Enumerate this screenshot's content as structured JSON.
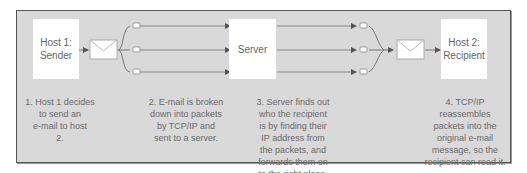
{
  "diagram": {
    "colors": {
      "background": "#d9d9d9",
      "frame_border": "#555555",
      "node_fill": "#ffffff",
      "line": "#777777",
      "text": "#666666"
    },
    "nodes": {
      "sender": {
        "label_line1": "Host 1:",
        "label_line2": "Sender"
      },
      "server": {
        "label": "Server"
      },
      "recipient": {
        "label_line1": "Host 2:",
        "label_line2": "Recipient"
      }
    },
    "icons": {
      "email_envelope": "envelope-icon",
      "packet": "packet-icon",
      "arrow": "arrowhead-icon"
    },
    "captions": [
      {
        "step": 1,
        "text": "1. Host 1 decides to send an e-mail to host 2."
      },
      {
        "step": 2,
        "text": "2. E-mail is broken down into packets by TCP/IP and sent to a server."
      },
      {
        "step": 3,
        "text": "3. Server finds out who the recipient is by finding their IP address from the packets, and forwards them on to the right place."
      },
      {
        "step": 4,
        "text": "4. TCP/IP reassembles packets into the original e-mail message, so the recipient can read it."
      }
    ],
    "caption_lines": {
      "c1": [
        "1. Host 1 decides",
        "to send an",
        "e-mail to host",
        "2."
      ],
      "c2": [
        "2. E-mail is broken",
        "down into packets",
        "by TCP/IP and",
        "sent to a server."
      ],
      "c3": [
        "3. Server finds out",
        "who the recipient",
        "is by finding their",
        "IP address from",
        "the packets, and",
        "forwards them on",
        "to the right place."
      ],
      "c4": [
        "4. TCP/IP reassembles",
        "packets into the",
        "original e-mail",
        "message, so the",
        "recipient can read it."
      ]
    },
    "packet_count": 3
  }
}
